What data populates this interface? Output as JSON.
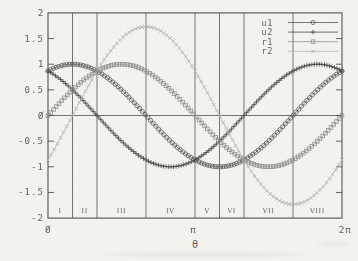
{
  "figure": {
    "width_px": 358,
    "height_px": 261,
    "background": "#f5f4ef",
    "axis_color": "#4f4f4f",
    "grid_color": "#646464",
    "tick_text_color": "#5f5f5f",
    "legend_text_color": "#8b8b8b",
    "region_text_color": "#515151"
  },
  "chart_data": {
    "type": "line",
    "title": "",
    "xlabel": "θ",
    "ylabel": "",
    "xlim_over_pi": [
      0,
      2
    ],
    "ylim": [
      -2,
      2
    ],
    "grid": "vertical section lines and horizontal zero axis only",
    "legend_position": "top-right-inside",
    "zero_line": true,
    "x_ticks": [
      {
        "pos_over_pi": 0,
        "label": "0"
      },
      {
        "pos_over_pi": 1,
        "label": "π"
      },
      {
        "pos_over_pi": 2,
        "label": "2π"
      }
    ],
    "y_ticks": [
      {
        "value": 2,
        "label": "2"
      },
      {
        "value": 1.5,
        "label": "1.5"
      },
      {
        "value": 1,
        "label": "1"
      },
      {
        "value": 0.5,
        "label": "0.5"
      },
      {
        "value": 0,
        "label": "0"
      },
      {
        "value": -0.5,
        "label": "-0.5"
      },
      {
        "value": -1,
        "label": "-1"
      },
      {
        "value": -1.5,
        "label": "-1.5"
      },
      {
        "value": -2,
        "label": "-2"
      }
    ],
    "region_boundaries_over_pi": [
      0.1667,
      0.3333,
      0.6667,
      1,
      1.1667,
      1.3333,
      1.6667
    ],
    "regions": [
      {
        "label": "I",
        "center_over_pi": 0.083
      },
      {
        "label": "II",
        "center_over_pi": 0.25
      },
      {
        "label": "III",
        "center_over_pi": 0.5
      },
      {
        "label": "IV",
        "center_over_pi": 0.833
      },
      {
        "label": "V",
        "center_over_pi": 1.083
      },
      {
        "label": "VI",
        "center_over_pi": 1.25
      },
      {
        "label": "VII",
        "center_over_pi": 1.5
      },
      {
        "label": "VIII",
        "center_over_pi": 1.833
      }
    ],
    "series": [
      {
        "name": "u1",
        "formula": "sin(θ + π/3)",
        "amplitude": 1,
        "phase_deg": 60,
        "marker": "circle",
        "color": "#585858",
        "key_points": "starts 0.87, peak 1.0 at π/6, zero at 2π/3, min -1.0 at 7π/6, zero at 5π/3, ends 0.87"
      },
      {
        "name": "u2",
        "formula": "sin(θ + 2π/3)",
        "amplitude": 1,
        "phase_deg": 120,
        "marker": "plus",
        "color": "#474747",
        "key_points": "starts 0.87 falling, zero at π/3, min -1.0 at 5π/6, zero at 4π/3, peak 1.0 at 11π/6, ends 0.87"
      },
      {
        "name": "r1",
        "formula": "sin(θ)",
        "amplitude": 1,
        "phase_deg": 0,
        "marker": "square",
        "color": "#8f8f8f",
        "key_points": "0 at 0, peak 1.0 at π/2, zero at π, min -1.0 at 3π/2, 0 at 2π"
      },
      {
        "name": "r2",
        "formula": "√3·sin(θ − π/6)",
        "amplitude": 1.732,
        "phase_deg": -30,
        "marker": "x",
        "color": "#b2b2b2",
        "key_points": "starts -0.87, zero at π/6, peak 1.73 at 2π/3, zero at 7π/6, min -1.73 at 5π/3, ends -0.87"
      }
    ]
  }
}
